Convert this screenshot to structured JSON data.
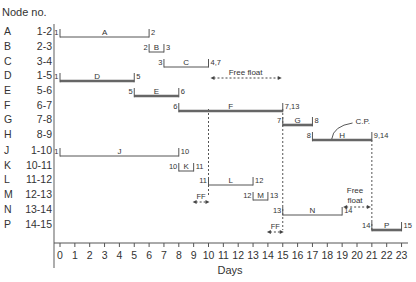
{
  "chart_data": {
    "type": "gantt",
    "title": "",
    "xlabel": "Days",
    "ylabel": "Node no.",
    "x_ticks": [
      0,
      1,
      2,
      3,
      4,
      5,
      6,
      7,
      8,
      9,
      10,
      11,
      12,
      13,
      14,
      15,
      16,
      17,
      18,
      19,
      20,
      21,
      22,
      23
    ],
    "xlim": [
      0,
      23
    ],
    "grid": false,
    "activities": [
      {
        "activity": "A",
        "nodes": "1-2",
        "start": 0,
        "end": 6,
        "start_label": "1",
        "end_label": "2",
        "critical": false
      },
      {
        "activity": "B",
        "nodes": "2-3",
        "start": 6,
        "end": 7,
        "start_label": "2",
        "end_label": "3",
        "critical": false
      },
      {
        "activity": "C",
        "nodes": "3-4",
        "start": 7,
        "end": 10,
        "start_label": "3",
        "end_label": "4,7",
        "critical": false
      },
      {
        "activity": "D",
        "nodes": "1-5",
        "start": 0,
        "end": 5,
        "start_label": "1",
        "end_label": "5",
        "critical": true
      },
      {
        "activity": "E",
        "nodes": "5-6",
        "start": 5,
        "end": 8,
        "start_label": "5",
        "end_label": "6",
        "critical": true
      },
      {
        "activity": "F",
        "nodes": "6-7",
        "start": 8,
        "end": 15,
        "start_label": "6",
        "end_label": "7,13",
        "critical": true
      },
      {
        "activity": "G",
        "nodes": "7-8",
        "start": 15,
        "end": 17,
        "start_label": "7",
        "end_label": "8",
        "critical": true
      },
      {
        "activity": "H",
        "nodes": "8-9",
        "start": 17,
        "end": 21,
        "start_label": "8",
        "end_label": "9,14",
        "critical": true
      },
      {
        "activity": "J",
        "nodes": "1-10",
        "start": 0,
        "end": 8,
        "start_label": "1",
        "end_label": "10",
        "critical": false
      },
      {
        "activity": "K",
        "nodes": "10-11",
        "start": 8,
        "end": 9,
        "start_label": "10",
        "end_label": "11",
        "critical": false
      },
      {
        "activity": "L",
        "nodes": "11-12",
        "start": 10,
        "end": 13,
        "start_label": "11",
        "end_label": "12",
        "critical": false
      },
      {
        "activity": "M",
        "nodes": "12-13",
        "start": 13,
        "end": 14,
        "start_label": "12",
        "end_label": "13",
        "critical": false
      },
      {
        "activity": "N",
        "nodes": "13-14",
        "start": 15,
        "end": 19,
        "start_label": "13",
        "end_label": "14",
        "critical": false
      },
      {
        "activity": "P",
        "nodes": "14-15",
        "start": 21,
        "end": 23,
        "start_label": "14",
        "end_label": "15",
        "critical": true
      }
    ],
    "annotations": [
      {
        "text": "Free float",
        "row": "C",
        "from": 10,
        "to": 15
      },
      {
        "text": "FF",
        "row": "L",
        "from": 9,
        "to": 10
      },
      {
        "text": "FF",
        "row": "N",
        "from": 14,
        "to": 15
      },
      {
        "text": "Free float",
        "row": "N",
        "from": 19,
        "to": 21
      },
      {
        "text": "C.P.",
        "row": "H",
        "note": "critical path callout"
      }
    ],
    "dashed_verticals": [
      10,
      15,
      21
    ]
  },
  "labels": {
    "header": "Node no.",
    "xlabel": "Days",
    "free_float": "Free float",
    "free_float_line1": "Free",
    "free_float_line2": "float",
    "ff": "FF",
    "cp": "C.P."
  },
  "rows": [
    {
      "activity": "A",
      "nodes": "1-2"
    },
    {
      "activity": "B",
      "nodes": "2-3"
    },
    {
      "activity": "C",
      "nodes": "3-4"
    },
    {
      "activity": "D",
      "nodes": "1-5"
    },
    {
      "activity": "E",
      "nodes": "5-6"
    },
    {
      "activity": "F",
      "nodes": "6-7"
    },
    {
      "activity": "G",
      "nodes": "7-8"
    },
    {
      "activity": "H",
      "nodes": "8-9"
    },
    {
      "activity": "J",
      "nodes": "1-10"
    },
    {
      "activity": "K",
      "nodes": "10-11"
    },
    {
      "activity": "L",
      "nodes": "11-12"
    },
    {
      "activity": "M",
      "nodes": "12-13"
    },
    {
      "activity": "N",
      "nodes": "13-14"
    },
    {
      "activity": "P",
      "nodes": "14-15"
    }
  ],
  "colors": {
    "line": "#555555",
    "critical": "#666666",
    "text": "#333333"
  }
}
